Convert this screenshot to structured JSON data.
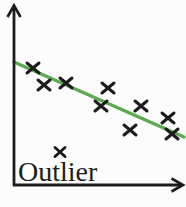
{
  "figure": {
    "outlier_label": "Outlier"
  },
  "colors": {
    "background": "#fcfcfc",
    "axis": "#1c1c1c",
    "marker": "#1c1c1c",
    "text": "#1c1c1c",
    "trend_line": "#5aaa50"
  },
  "chart_data": {
    "type": "scatter",
    "title": "",
    "xlabel": "",
    "ylabel": "",
    "grid": false,
    "legend": false,
    "axis_ticks": false,
    "xlim": [
      0,
      10
    ],
    "ylim": [
      0,
      10
    ],
    "series": [
      {
        "name": "data-points",
        "marker": "x",
        "points": [
          [
            1.1,
            6.6
          ],
          [
            1.8,
            5.6
          ],
          [
            3.1,
            5.8
          ],
          [
            5.5,
            5.5
          ],
          [
            5.1,
            4.5
          ],
          [
            7.5,
            4.5
          ],
          [
            9.1,
            3.8
          ],
          [
            6.8,
            3.1
          ],
          [
            9.3,
            2.9
          ]
        ]
      }
    ],
    "outlier_point": [
      2.7,
      1.9
    ],
    "trend_line": {
      "x1": 0,
      "y1": 6.9,
      "x2": 10,
      "y2": 2.7
    },
    "annotations": [
      {
        "text": "Outlier",
        "target": "outlier_point"
      }
    ],
    "render_px": {
      "canvas": [
        186,
        207
      ],
      "y_axis": {
        "x": 14,
        "y_top": 7,
        "y_bottom": 186
      },
      "x_axis": {
        "y": 185,
        "x_left": 13,
        "x_right": 181
      },
      "y_arrow": "7.5,17 14,5.5 20.5,17",
      "x_arrow": "171.5,178.5 183,185 171.5,191.5",
      "points": [
        [
          33,
          68
        ],
        [
          44,
          85
        ],
        [
          66,
          83
        ],
        [
          108,
          88
        ],
        [
          101,
          106
        ],
        [
          141,
          106
        ],
        [
          168,
          118
        ],
        [
          130,
          130
        ],
        [
          172,
          134
        ]
      ],
      "outlier": [
        60,
        152
      ],
      "trend": {
        "x1": 14,
        "y1": 62,
        "x2": 184,
        "y2": 137
      },
      "marker_half_width": 6,
      "marker_half_height": 5,
      "outlier_half_width": 5,
      "outlier_half_height": 4.5,
      "label_pos": [
        18,
        181
      ],
      "label_font_size": 28
    }
  }
}
